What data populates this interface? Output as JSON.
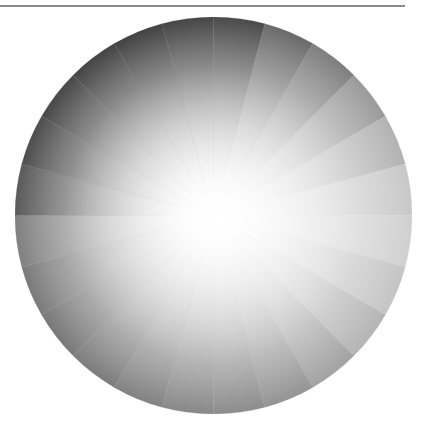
{
  "figure": {
    "segment_count": 24,
    "center": [
      213,
      215
    ],
    "radius": 198,
    "rule_color": "#8a8a8a",
    "center_glow_color": "#ffffff",
    "segments": [
      {
        "start": -90,
        "rim": "#4a4a4a"
      },
      {
        "start": -75,
        "rim": "#6a6a6a"
      },
      {
        "start": -60,
        "rim": "#7e7e7e"
      },
      {
        "start": -45,
        "rim": "#9a9a9a"
      },
      {
        "start": -30,
        "rim": "#b2b2b2"
      },
      {
        "start": -15,
        "rim": "#c8c8c8"
      },
      {
        "start": 0,
        "rim": "#d0d0d0"
      },
      {
        "start": 15,
        "rim": "#c4c4c4"
      },
      {
        "start": 30,
        "rim": "#b4b4b4"
      },
      {
        "start": 45,
        "rim": "#a2a2a2"
      },
      {
        "start": 60,
        "rim": "#949494"
      },
      {
        "start": 75,
        "rim": "#8c8c8c"
      },
      {
        "start": 90,
        "rim": "#888888"
      },
      {
        "start": 105,
        "rim": "#828282"
      },
      {
        "start": 120,
        "rim": "#7c7c7c"
      },
      {
        "start": 135,
        "rim": "#787878"
      },
      {
        "start": 150,
        "rim": "#7a7a7a"
      },
      {
        "start": 165,
        "rim": "#808080"
      },
      {
        "start": 180,
        "rim": "#5a5a5a"
      },
      {
        "start": 195,
        "rim": "#4e4e4e"
      },
      {
        "start": 210,
        "rim": "#484848"
      },
      {
        "start": 225,
        "rim": "#444444"
      },
      {
        "start": 240,
        "rim": "#424242"
      },
      {
        "start": 255,
        "rim": "#464646"
      }
    ]
  }
}
